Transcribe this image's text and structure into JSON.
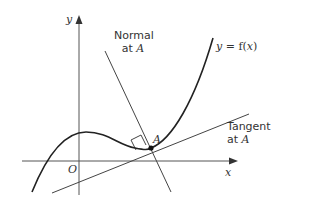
{
  "diagram": {
    "axes": {
      "x_label": "x",
      "y_label": "y",
      "origin_label": "O"
    },
    "curve": {
      "label_lhs": "y",
      "label_eq": " = ",
      "label_rhs": "f(",
      "label_var": "x",
      "label_close": ")"
    },
    "normal": {
      "line1": "Normal",
      "line2_prefix": "at ",
      "line2_point": "A"
    },
    "tangent": {
      "line1": "Tangent",
      "line2_prefix": "at ",
      "line2_point": "A"
    },
    "point": {
      "label": "A"
    },
    "colors": {
      "curve": "#222222",
      "lines": "#444444",
      "text": "#333333"
    }
  }
}
